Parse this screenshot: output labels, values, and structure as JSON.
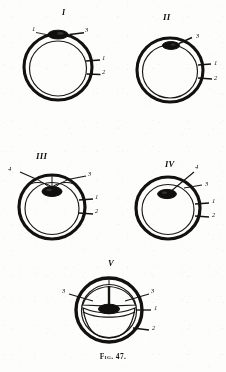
{
  "plate": {
    "caption": "Fig. 47.",
    "ink_color": "#121110",
    "paper_color": "#fdfdfc",
    "width": 226,
    "height": 372
  },
  "figures": [
    {
      "id": "figure-1",
      "roman": "I",
      "labels": [
        {
          "key": "l1",
          "text": "1"
        },
        {
          "key": "l2",
          "text": "3"
        },
        {
          "key": "l3",
          "text": "1"
        },
        {
          "key": "l4",
          "text": "2"
        }
      ]
    },
    {
      "id": "figure-2",
      "roman": "II",
      "labels": [
        {
          "key": "l1",
          "text": "3"
        },
        {
          "key": "l2",
          "text": "1"
        },
        {
          "key": "l3",
          "text": "2"
        }
      ]
    },
    {
      "id": "figure-3",
      "roman": "III",
      "labels": [
        {
          "key": "l1",
          "text": "4"
        },
        {
          "key": "l2",
          "text": "3"
        },
        {
          "key": "l3",
          "text": "1"
        },
        {
          "key": "l4",
          "text": "2"
        }
      ]
    },
    {
      "id": "figure-4",
      "roman": "IV",
      "labels": [
        {
          "key": "l1",
          "text": "4"
        },
        {
          "key": "l2",
          "text": "3"
        },
        {
          "key": "l3",
          "text": "1"
        },
        {
          "key": "l4",
          "text": "2"
        }
      ]
    },
    {
      "id": "figure-5",
      "roman": "V",
      "labels": [
        {
          "key": "l1",
          "text": "3"
        },
        {
          "key": "l2",
          "text": "3"
        },
        {
          "key": "l3",
          "text": "1"
        },
        {
          "key": "l4",
          "text": "2"
        }
      ]
    }
  ]
}
